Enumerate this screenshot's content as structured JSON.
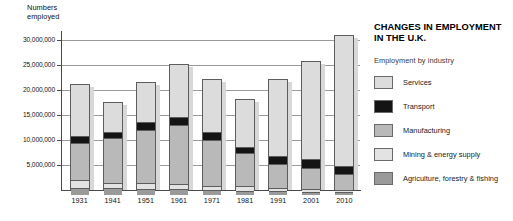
{
  "chart_data": {
    "type": "bar",
    "subtype": "stacked",
    "title": "CHANGES IN EMPLOYMENT IN THE U.K.",
    "title_lines": "CHANGES IN EMPLOYMENT\nIN THE U.K.",
    "legend_heading": "Employment by industry",
    "legend_position": "right",
    "grid": true,
    "xlabel": "",
    "ylabel": "Numbers employed",
    "ylabel_lines": "Numbers\nemployed",
    "ylim": [
      0,
      31500000
    ],
    "yticks": [
      5000000,
      10000000,
      15000000,
      20000000,
      25000000,
      30000000
    ],
    "ytick_labels": [
      "5,000,000",
      "10,000,000",
      "15,000,000",
      "20,000,000",
      "25,000,000",
      "30,000,000"
    ],
    "categories": [
      "1931",
      "1941",
      "1951",
      "1961",
      "1971",
      "1981",
      "1991",
      "2001",
      "2010"
    ],
    "series": [
      {
        "name": "Agriculture, forestry & fishing",
        "color": "#9a9a9a",
        "values": [
          1300000,
          1100000,
          1000000,
          900000,
          700000,
          600000,
          500000,
          400000,
          400000
        ]
      },
      {
        "name": "Mining & energy supply",
        "color": "#e3e3e3",
        "values": [
          1200000,
          900000,
          1000000,
          900000,
          700000,
          700000,
          400000,
          300000,
          200000
        ]
      },
      {
        "name": "Manufacturing",
        "color": "#b9b9b9",
        "values": [
          7200000,
          8800000,
          10300000,
          11600000,
          9000000,
          6400000,
          4700000,
          4100000,
          3000000
        ]
      },
      {
        "name": "Transport",
        "color": "#141414",
        "values": [
          1200000,
          900000,
          1500000,
          1400000,
          1300000,
          1100000,
          1300000,
          1500000,
          1400000
        ]
      },
      {
        "name": "Services",
        "color": "#dcdcdc",
        "values": [
          10300000,
          5900000,
          7800000,
          10300000,
          10500000,
          9400000,
          15300000,
          19500000,
          26000000
        ]
      }
    ],
    "totals": [
      21200000,
      17600000,
      21600000,
      25100000,
      22200000,
      18200000,
      22200000,
      25800000,
      31000000
    ]
  }
}
